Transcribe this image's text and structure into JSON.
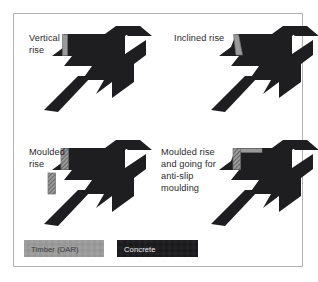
{
  "figure": {
    "background_color": "#ffffff",
    "frame_color": "#b3b3b3",
    "concrete_color": "#1e1e20",
    "timber_color": "#9a9a9a",
    "timber_hatch_color": "#3d3d3d",
    "timber_edge_color": "#6e6e6e"
  },
  "diagrams": [
    {
      "id": "vertical-rise",
      "label_lines": [
        "Vertical",
        "rise"
      ],
      "timber_style": "plain-vertical-strip"
    },
    {
      "id": "inclined-rise",
      "label_lines": [
        "Inclined rise"
      ],
      "timber_style": "slanted-strip"
    },
    {
      "id": "moulded-rise",
      "label_lines": [
        "Moulded",
        "rise"
      ],
      "timber_style": "hatched-double-strip"
    },
    {
      "id": "moulded-rise-and-going",
      "label_lines": [
        "Moulded rise",
        "and going for",
        "anti-slip",
        "moulding"
      ],
      "timber_style": "hatched-strip-with-nosing"
    }
  ],
  "legend": {
    "items": [
      {
        "id": "timber",
        "label": "Timber (DAR)",
        "swatch_color": "#9a9a9a",
        "text_color": "#3a3a3a"
      },
      {
        "id": "concrete",
        "label": "Concrete",
        "swatch_color": "#1e1e20",
        "text_color": "#f2f2f2"
      }
    ]
  }
}
